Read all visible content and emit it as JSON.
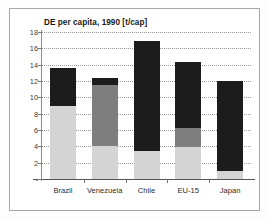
{
  "chart_data": {
    "type": "bar",
    "subtype": "stacked",
    "title": "DE per capita, 1990 [t/cap]",
    "xlabel": "",
    "ylabel": "",
    "ylim": [
      0,
      18
    ],
    "ytick_values": [
      0,
      2,
      4,
      6,
      8,
      10,
      12,
      14,
      16,
      18
    ],
    "ytick_labels": [
      "-",
      "2",
      "4",
      "6",
      "8",
      "10",
      "12",
      "14",
      "16",
      "18"
    ],
    "grid": true,
    "legend": "none",
    "categories": [
      "Brazil",
      "Venezuela",
      "Chile",
      "EU-15",
      "Japan"
    ],
    "series": [
      {
        "name": "light-segment",
        "color": "#d4d4d4",
        "values": [
          8.9,
          4.1,
          3.4,
          3.9,
          1.0
        ]
      },
      {
        "name": "mid-segment",
        "color": "#7e7e7e",
        "values": [
          0.0,
          7.4,
          0.0,
          2.4,
          0.0
        ]
      },
      {
        "name": "dark-segment",
        "color": "#1c1c1c",
        "values": [
          4.7,
          0.9,
          13.5,
          8.0,
          11.0
        ]
      }
    ],
    "totals": [
      13.6,
      12.4,
      16.9,
      14.3,
      12.0
    ]
  },
  "colors": {
    "light": "#d4d4d4",
    "mid": "#7e7e7e",
    "dark": "#1c1c1c",
    "axis": "#555555",
    "grid": "#9a9a9a",
    "frame": "#a8a8a8",
    "text": "#1a1a1a"
  }
}
